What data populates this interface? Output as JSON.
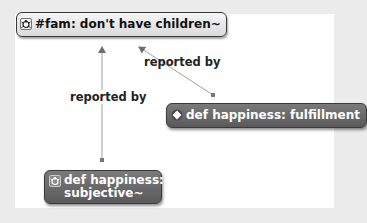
{
  "diagram": {
    "background_color": "#ebebeb",
    "canvas_color": "#ffffff",
    "nodes": [
      {
        "id": "fam",
        "icon": "bug-icon",
        "label": "#fam: don't have children~",
        "style": "light"
      },
      {
        "id": "fulfillment",
        "icon": "diamond-icon",
        "label": "def happiness: fulfillment",
        "style": "dark"
      },
      {
        "id": "subjective",
        "icon": "bug-icon",
        "label_line1": "def happiness: is",
        "label_line2": "subjective~",
        "style": "dark"
      }
    ],
    "edges": [
      {
        "from": "subjective",
        "to": "fam",
        "label": "reported by"
      },
      {
        "from": "fulfillment",
        "to": "fam",
        "label": "reported by"
      }
    ],
    "colors": {
      "light_node": "#e6e6e6",
      "dark_node": "#6a6a6a",
      "edge": "#9a9a9a",
      "arrowhead": "#707070"
    }
  }
}
